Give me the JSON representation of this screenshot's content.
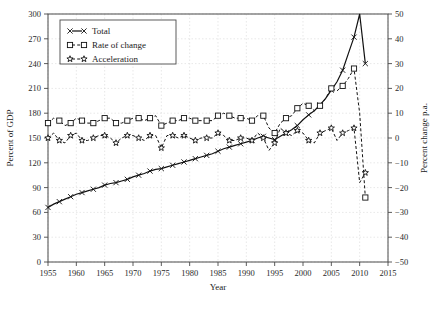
{
  "chart_data": {
    "type": "line",
    "title": "",
    "xlabel": "Year",
    "ylabel": "Percent of GDP",
    "y2label": "Percent change p.a.",
    "xlim": [
      1955,
      2015
    ],
    "ylim": [
      0,
      300
    ],
    "y2lim": [
      -50,
      50
    ],
    "grid": true,
    "legend_position": "top-left",
    "xticks": [
      "1955",
      "1960",
      "1965",
      "1970",
      "1975",
      "1980",
      "1985",
      "1990",
      "1995",
      "2000",
      "2005",
      "2010",
      "2015"
    ],
    "yticks": [
      "0",
      "30",
      "60",
      "90",
      "120",
      "150",
      "180",
      "210",
      "240",
      "270",
      "300"
    ],
    "y2ticks": [
      "-50",
      "-40",
      "-30",
      "-20",
      "-10",
      "0",
      "10",
      "20",
      "30",
      "40",
      "50"
    ],
    "series": [
      {
        "name": "Total",
        "axis": "left",
        "marker": "x-cross",
        "linestyle": "solid",
        "x": [
          1955,
          1956,
          1957,
          1958,
          1959,
          1960,
          1961,
          1962,
          1963,
          1964,
          1965,
          1966,
          1967,
          1968,
          1969,
          1970,
          1971,
          1972,
          1973,
          1974,
          1975,
          1976,
          1977,
          1978,
          1979,
          1980,
          1981,
          1982,
          1983,
          1984,
          1985,
          1986,
          1987,
          1988,
          1989,
          1990,
          1991,
          1992,
          1993,
          1994,
          1995,
          1996,
          1997,
          1998,
          1999,
          2000,
          2001,
          2002,
          2003,
          2004,
          2005,
          2006,
          2007,
          2008,
          2009,
          2010,
          2011
        ],
        "values": [
          66,
          70,
          73,
          76,
          79,
          82,
          84,
          86,
          88,
          90,
          93,
          95,
          96,
          98,
          100,
          103,
          105,
          107,
          110,
          112,
          113,
          115,
          117,
          119,
          121,
          123,
          125,
          127,
          129,
          131,
          134,
          137,
          139,
          141,
          143,
          145,
          147,
          150,
          152,
          150,
          148,
          152,
          156,
          160,
          165,
          172,
          178,
          183,
          190,
          198,
          208,
          218,
          232,
          252,
          272,
          300,
          240
        ]
      },
      {
        "name": "Rate of change",
        "axis": "right",
        "marker": "square",
        "linestyle": "dashed",
        "x": [
          1955,
          1956,
          1957,
          1958,
          1959,
          1960,
          1961,
          1962,
          1963,
          1964,
          1965,
          1966,
          1967,
          1968,
          1969,
          1970,
          1971,
          1972,
          1973,
          1974,
          1975,
          1976,
          1977,
          1978,
          1979,
          1980,
          1981,
          1982,
          1983,
          1984,
          1985,
          1986,
          1987,
          1988,
          1989,
          1990,
          1991,
          1992,
          1993,
          1994,
          1995,
          1996,
          1997,
          1998,
          1999,
          2000,
          2001,
          2002,
          2003,
          2004,
          2005,
          2006,
          2007,
          2008,
          2009,
          2010,
          2011
        ],
        "values": [
          6,
          8,
          7,
          5,
          6,
          8,
          7,
          6,
          6,
          7,
          8,
          8,
          6,
          6,
          7,
          8,
          8,
          7,
          8,
          9,
          5,
          6,
          7,
          7,
          8,
          8,
          7,
          7,
          7,
          7,
          9,
          10,
          9,
          8,
          8,
          8,
          7,
          9,
          9,
          4,
          2,
          6,
          8,
          9,
          12,
          14,
          13,
          11,
          13,
          16,
          20,
          19,
          21,
          24,
          28,
          10,
          -24
        ]
      },
      {
        "name": "Acceleration",
        "axis": "right",
        "marker": "star",
        "linestyle": "dashed",
        "x": [
          1955,
          1956,
          1957,
          1958,
          1959,
          1960,
          1961,
          1962,
          1963,
          1964,
          1965,
          1966,
          1967,
          1968,
          1969,
          1970,
          1971,
          1972,
          1973,
          1974,
          1975,
          1976,
          1977,
          1978,
          1979,
          1980,
          1981,
          1982,
          1983,
          1984,
          1985,
          1986,
          1987,
          1988,
          1989,
          1990,
          1991,
          1992,
          1993,
          1994,
          1995,
          1996,
          1997,
          1998,
          1999,
          2000,
          2001,
          2002,
          2003,
          2004,
          2005,
          2006,
          2007,
          2008,
          2009,
          2010,
          2011
        ],
        "values": [
          0,
          2,
          -1,
          -2,
          1,
          2,
          -1,
          -1,
          0,
          1,
          1,
          0,
          -2,
          0,
          1,
          1,
          0,
          -1,
          1,
          1,
          -4,
          1,
          1,
          0,
          1,
          0,
          -1,
          0,
          0,
          0,
          2,
          1,
          -1,
          -1,
          0,
          0,
          -1,
          2,
          0,
          -5,
          -2,
          4,
          2,
          1,
          3,
          2,
          -1,
          -2,
          2,
          3,
          4,
          -1,
          2,
          3,
          4,
          -18,
          -14
        ]
      }
    ]
  },
  "legend": {
    "items": [
      {
        "label": "Total",
        "marker": "x-cross"
      },
      {
        "label": "Rate of change",
        "marker": "square"
      },
      {
        "label": "Acceleration",
        "marker": "star"
      }
    ]
  }
}
